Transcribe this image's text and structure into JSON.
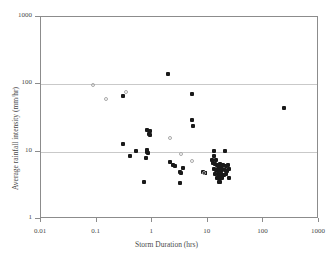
{
  "chart_data": {
    "type": "scatter",
    "title": "",
    "xlabel": "Storm Duration (hrs)",
    "ylabel": "Average rainfall intensity (mm/hr)",
    "xscale": "log",
    "yscale": "log",
    "xlim": [
      0.01,
      1000
    ],
    "ylim": [
      1,
      1000
    ],
    "xticks": [
      "0.01",
      "0.1",
      "1",
      "10",
      "100",
      "1000"
    ],
    "xtick_values": [
      0.01,
      0.1,
      1,
      10,
      100,
      1000
    ],
    "yticks": [
      "1",
      "10",
      "100",
      "1000"
    ],
    "ytick_values": [
      1,
      10,
      100,
      1000
    ],
    "grid": "horizontal-major",
    "gridlines_y": [
      10,
      100
    ],
    "legend": "none",
    "series": [
      {
        "name": "filled-markers",
        "marker": "filled-square",
        "color": "#1a1a1a",
        "points": [
          [
            1.9,
            140
          ],
          [
            0.3,
            68
          ],
          [
            5.3,
            72
          ],
          [
            230,
            45
          ],
          [
            5.1,
            30
          ],
          [
            5.4,
            24
          ],
          [
            0.8,
            21
          ],
          [
            0.9,
            20
          ],
          [
            0.86,
            18
          ],
          [
            0.92,
            17.5
          ],
          [
            0.3,
            13
          ],
          [
            0.52,
            10.3
          ],
          [
            0.8,
            10.6
          ],
          [
            0.82,
            10.0
          ],
          [
            0.84,
            9.6
          ],
          [
            0.4,
            8.6
          ],
          [
            0.78,
            8.0
          ],
          [
            13,
            10.4
          ],
          [
            20,
            10.4
          ],
          [
            13,
            8.6
          ],
          [
            12,
            7.6
          ],
          [
            14,
            7.4
          ],
          [
            2.1,
            7.1
          ],
          [
            2.4,
            6.4
          ],
          [
            2.6,
            6.1
          ],
          [
            3.6,
            5.7
          ],
          [
            3.1,
            5.0
          ],
          [
            3.3,
            4.9
          ],
          [
            8.3,
            5.0
          ],
          [
            8.8,
            4.9
          ],
          [
            9.0,
            4.8
          ],
          [
            12.5,
            6.8
          ],
          [
            13.5,
            6.5
          ],
          [
            14.5,
            6.3
          ],
          [
            15.5,
            6.2
          ],
          [
            16.5,
            6.6
          ],
          [
            17.5,
            6.0
          ],
          [
            19,
            6.3
          ],
          [
            21,
            6.1
          ],
          [
            23,
            6.4
          ],
          [
            13,
            5.6
          ],
          [
            14,
            5.4
          ],
          [
            15,
            5.3
          ],
          [
            16,
            5.5
          ],
          [
            17,
            5.2
          ],
          [
            18,
            5.6
          ],
          [
            20,
            5.4
          ],
          [
            22,
            5.1
          ],
          [
            24,
            5.5
          ],
          [
            13.5,
            4.7
          ],
          [
            15,
            4.6
          ],
          [
            16,
            4.5
          ],
          [
            17.5,
            4.7
          ],
          [
            19.5,
            4.5
          ],
          [
            21.5,
            4.6
          ],
          [
            14.5,
            4.1
          ],
          [
            15.5,
            4.0
          ],
          [
            16.5,
            4.05
          ],
          [
            18,
            4.1
          ],
          [
            24,
            4.0
          ],
          [
            0.72,
            3.5
          ],
          [
            3.1,
            3.4
          ],
          [
            16,
            3.6
          ],
          [
            16.8,
            3.5
          ]
        ]
      },
      {
        "name": "open-markers",
        "marker": "open-circle",
        "color": "#a8a8a8",
        "points": [
          [
            0.085,
            97
          ],
          [
            0.15,
            60
          ],
          [
            0.34,
            76
          ],
          [
            2.1,
            16
          ],
          [
            3.3,
            9.3
          ],
          [
            5.2,
            7.2
          ],
          [
            8.6,
            4.9
          ]
        ]
      }
    ]
  },
  "axes": {
    "x_title": "Storm Duration (hrs)",
    "y_title": "Average rainfall intensity (mm/hr)"
  }
}
